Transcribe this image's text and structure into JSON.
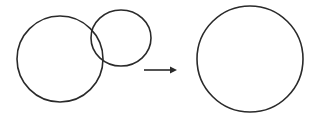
{
  "diagram": {
    "stroke_color": "#2a2a2a",
    "background": "#ffffff",
    "before": {
      "large_circle": {
        "cx": 60,
        "cy": 59,
        "r": 43
      },
      "small_circle": {
        "cx": 121,
        "cy": 38,
        "rx": 30,
        "ry": 28
      }
    },
    "arrow": {
      "x1": 144,
      "y1": 70,
      "x2": 177,
      "y2": 70,
      "direction": "right"
    },
    "after": {
      "merged_circle": {
        "cx": 250,
        "cy": 59,
        "r": 53
      }
    }
  }
}
